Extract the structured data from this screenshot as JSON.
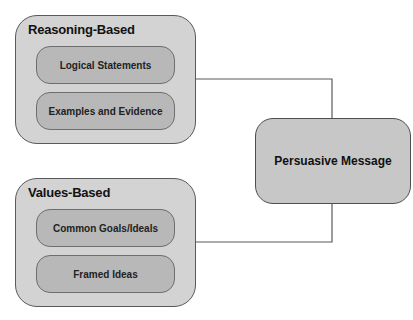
{
  "diagram": {
    "groups": [
      {
        "title": "Reasoning-Based",
        "items": [
          "Logical Statements",
          "Examples and Evidence"
        ]
      },
      {
        "title": "Values-Based",
        "items": [
          "Common Goals/Ideals",
          "Framed Ideas"
        ]
      }
    ],
    "target": "Persuasive Message",
    "connections": [
      {
        "from": "Reasoning-Based",
        "to": "Persuasive Message"
      },
      {
        "from": "Values-Based",
        "to": "Persuasive Message"
      }
    ],
    "colors": {
      "outer_fill": "#d3d3d3",
      "inner_fill": "#b8b8b8",
      "target_fill": "#c7c7c7",
      "stroke": "#5a5a5a"
    }
  }
}
